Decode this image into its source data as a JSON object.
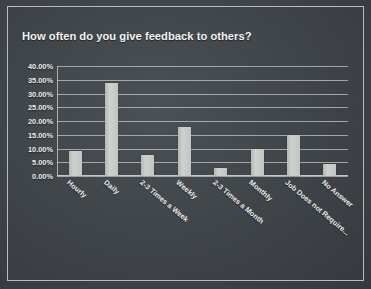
{
  "slide": {
    "title": "How often do you give feedback to others?",
    "background_color": "#40454a",
    "border_color": "#b9bcbd",
    "bar_color": "#c6c8c6",
    "text_color": "#f0f1f1"
  },
  "chart_data": {
    "type": "bar",
    "title": "How often do you give feedback to others?",
    "xlabel": "",
    "ylabel": "",
    "categories": [
      "Hourly",
      "Daily",
      "2-3 Times a Week",
      "Weekly",
      "2-3 Times a Month",
      "Monthly",
      "Job Does not Require...",
      "No Answer"
    ],
    "values": [
      9.1,
      33.8,
      7.5,
      17.8,
      3.0,
      9.8,
      15.0,
      4.4
    ],
    "value_labels": [
      "9.10%",
      "33.80%",
      "7.50%",
      "17.80%",
      "3.00%",
      "9.80%",
      "15.00%",
      "4.40%"
    ],
    "ylim": [
      0,
      40
    ],
    "ytick_values": [
      40,
      35,
      30,
      25,
      20,
      15,
      10,
      5,
      0
    ],
    "ytick_labels": [
      "40.00%",
      "35.00%",
      "30.00%",
      "25.00%",
      "20.00%",
      "15.00%",
      "10.00%",
      "5.00%",
      "0.00%"
    ],
    "grid": true,
    "legend": false,
    "legend_position": "none"
  }
}
